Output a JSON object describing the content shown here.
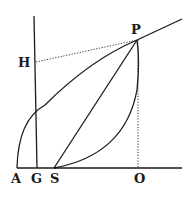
{
  "diagram": {
    "labels": {
      "P": "P",
      "H": "H",
      "A": "A",
      "G": "G",
      "S": "S",
      "O": "O"
    },
    "colors": {
      "ink": "#1a1a1a",
      "background": "#ffffff"
    }
  }
}
